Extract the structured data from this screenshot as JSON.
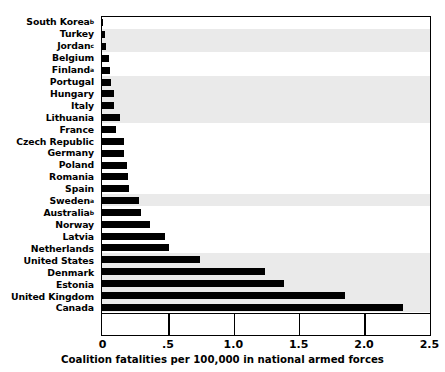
{
  "chart_data": {
    "type": "bar",
    "orientation": "horizontal",
    "title": "",
    "xlabel": "Coalition fatalities per 100,000 in national armed forces",
    "ylabel": "",
    "xlim": [
      0,
      2.5
    ],
    "xticks": [
      0,
      0.5,
      1.0,
      1.5,
      2.0,
      2.5
    ],
    "xtick_labels": [
      "0",
      ".5",
      "1.0",
      "1.5",
      "2.0",
      "2.5"
    ],
    "grid": false,
    "legend": null,
    "bar_color": "#000000",
    "band_color": "#eaeaea",
    "background_color": "#ffffff",
    "categories": [
      "South Korea",
      "Turkey",
      "Jordan",
      "Belgium",
      "Finland",
      "Portugal",
      "Hungary",
      "Italy",
      "Lithuania",
      "France",
      "Czech Republic",
      "Germany",
      "Poland",
      "Romania",
      "Spain",
      "Sweden",
      "Australia",
      "Norway",
      "Latvia",
      "Netherlands",
      "United States",
      "Denmark",
      "Estonia",
      "United Kingdom",
      "Canada"
    ],
    "category_footnotes": [
      "b",
      "",
      "c",
      "",
      "a",
      "",
      "",
      "",
      "",
      "",
      "",
      "",
      "",
      "",
      "",
      "a",
      "b",
      "",
      "",
      "",
      "",
      "",
      "",
      "",
      ""
    ],
    "values": [
      0.01,
      0.02,
      0.03,
      0.05,
      0.06,
      0.07,
      0.09,
      0.09,
      0.14,
      0.11,
      0.17,
      0.17,
      0.19,
      0.2,
      0.21,
      0.28,
      0.3,
      0.37,
      0.48,
      0.51,
      0.75,
      1.25,
      1.39,
      1.86,
      2.3
    ]
  }
}
